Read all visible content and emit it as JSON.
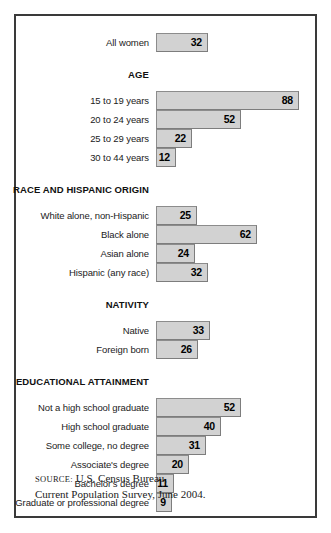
{
  "chart_data": {
    "type": "bar",
    "orientation": "horizontal",
    "title": "",
    "xlabel": "",
    "ylabel": "",
    "xlim": [
      0,
      92
    ],
    "grid": false,
    "legend": null,
    "value_labels": true,
    "categories": [
      "All women",
      "15 to 19 years",
      "20 to 24 years",
      "25 to 29 years",
      "30 to 44 years",
      "White alone, non-Hispanic",
      "Black alone",
      "Asian alone",
      "Hispanic (any race)",
      "Native",
      "Foreign born",
      "Not a high school graduate",
      "High school graduate",
      "Some college, no degree",
      "Associate's degree",
      "Bachelor's degree",
      "Graduate or professional degree"
    ],
    "values": [
      32,
      88,
      52,
      22,
      12,
      25,
      62,
      24,
      32,
      33,
      26,
      52,
      40,
      31,
      20,
      11,
      9
    ],
    "groups": [
      {
        "header": "",
        "rows": [
          {
            "label": "All women",
            "value": 32
          }
        ]
      },
      {
        "header": "AGE",
        "rows": [
          {
            "label": "15 to 19 years",
            "value": 88
          },
          {
            "label": "20 to 24 years",
            "value": 52
          },
          {
            "label": "25 to 29 years",
            "value": 22
          },
          {
            "label": "30 to 44 years",
            "value": 12
          }
        ]
      },
      {
        "header": "RACE AND HISPANIC ORIGIN",
        "rows": [
          {
            "label": "White alone, non-Hispanic",
            "value": 25
          },
          {
            "label": "Black alone",
            "value": 62
          },
          {
            "label": "Asian alone",
            "value": 24
          },
          {
            "label": "Hispanic (any race)",
            "value": 32
          }
        ]
      },
      {
        "header": "NATIVITY",
        "rows": [
          {
            "label": "Native",
            "value": 33
          },
          {
            "label": "Foreign born",
            "value": 26
          }
        ]
      },
      {
        "header": "EDUCATIONAL ATTAINMENT",
        "rows": [
          {
            "label": "Not a high school graduate",
            "value": 52
          },
          {
            "label": "High school graduate",
            "value": 40
          },
          {
            "label": "Some college, no degree",
            "value": 31
          },
          {
            "label": "Associate's degree",
            "value": 20
          },
          {
            "label": "Bachelor's degree",
            "value": 11
          },
          {
            "label": "Graduate or professional degree",
            "value": 9
          }
        ]
      }
    ],
    "colors": {
      "bar_fill": "#d2d2d2",
      "bar_border": "#8c8c8c",
      "frame_border": "#3a3a3a",
      "text": "#1b1b1b",
      "background": "#ffffff"
    }
  },
  "source": {
    "label": "SOURCE:",
    "line1": " U.S. Census Bureau,",
    "line2": "Current Population Survey, June 2004."
  }
}
